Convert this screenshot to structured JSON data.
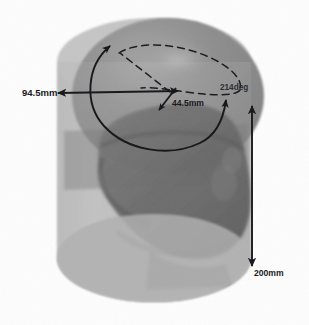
{
  "figure": {
    "background_color": "#fdfdfd",
    "annotation_color": "#16161a",
    "cylinder_color": "#b9b9b9",
    "cylinder_color_dark": "#9a9a9a",
    "dome_color": "#8f8f8f",
    "head_color": "#5e5e5e",
    "head_color_dark": "#4a4a4a"
  },
  "dimensions": [
    {
      "id": "diameter",
      "value": "94.5mm",
      "kind": "length",
      "arrow": "double-headed-horizontal",
      "position": "left"
    },
    {
      "id": "radius",
      "value": "44.5mm",
      "kind": "length",
      "arrow": "single-headed-diagonal",
      "position": "center"
    },
    {
      "id": "arc-angle",
      "value": "214deg",
      "kind": "angle",
      "arrow": "double-headed-arc",
      "position": "right"
    },
    {
      "id": "height",
      "value": "200mm",
      "kind": "length",
      "arrow": "double-headed-vertical",
      "position": "bottom-right"
    }
  ],
  "labels": {
    "diameter": "94.5mm",
    "radius": "44.5mm",
    "angle": "214deg",
    "height": "200mm"
  },
  "shapes": {
    "cylinder": "transparent-cylinder",
    "dome": "sphere-dome",
    "head": "human-head-profile",
    "top_ellipse": "dashed-ellipse"
  }
}
